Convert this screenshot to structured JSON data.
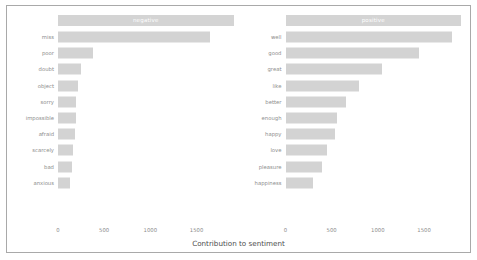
{
  "chart_data": {
    "type": "bar",
    "orientation": "horizontal",
    "title": "",
    "xlabel": "Contribution to sentiment",
    "ylabel": "",
    "xlim": [
      0,
      1900
    ],
    "xticks": [
      0,
      500,
      1000,
      1500
    ],
    "xtick_labels": [
      "0",
      "500",
      "1000",
      "1500"
    ],
    "grid": false,
    "legend": "none",
    "facets": [
      {
        "name": "negative",
        "label": "negative",
        "categories": [
          "miss",
          "poor",
          "doubt",
          "object",
          "sorry",
          "impossible",
          "afraid",
          "scarcely",
          "bad",
          "anxious"
        ],
        "values": [
          1650,
          375,
          250,
          215,
          195,
          190,
          185,
          165,
          155,
          135
        ]
      },
      {
        "name": "positive",
        "label": "positive",
        "categories": [
          "well",
          "good",
          "great",
          "like",
          "better",
          "enough",
          "happy",
          "love",
          "pleasure",
          "happiness"
        ],
        "values": [
          1800,
          1450,
          1050,
          800,
          650,
          560,
          540,
          450,
          400,
          300
        ]
      }
    ]
  },
  "style": {
    "bar_color": "#d3d3d3",
    "strip_fill": "#d4d4d4",
    "strip_text_color": "#ffffff",
    "axis_text_color": "#8c8c8c",
    "axis_title_color": "#4d4d4d",
    "panel_background": "#ffffff",
    "frame_color": "#a9a9a9"
  }
}
